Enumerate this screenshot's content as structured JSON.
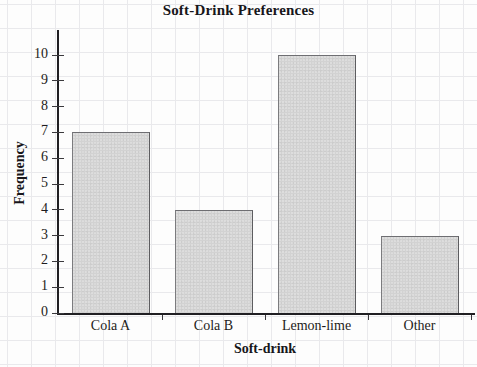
{
  "chart_data": {
    "type": "bar",
    "title": "Soft-Drink Preferences",
    "xlabel": "Soft-drink",
    "ylabel": "Frequency",
    "categories": [
      "Cola A",
      "Cola B",
      "Lemon-lime",
      "Other"
    ],
    "values": [
      7,
      4,
      10,
      3
    ],
    "ylim": [
      0,
      10
    ],
    "y_ticks": [
      0,
      1,
      2,
      3,
      4,
      5,
      6,
      7,
      8,
      9,
      10
    ],
    "y_tick_labels": [
      "0",
      "1",
      "2",
      "3",
      "4",
      "5",
      "6",
      "7",
      "8",
      "9",
      "10"
    ],
    "grid": false,
    "legend": null,
    "bar_fill_color": "#d2d2d2",
    "bar_edge_color": "#6e6e72",
    "axis_color": "#201f23",
    "text_color": "#1d1c20",
    "paper_grid_color": "#e9e9ec"
  }
}
